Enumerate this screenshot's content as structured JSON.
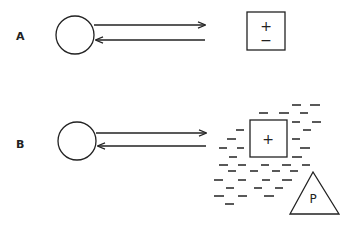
{
  "panels": [
    {
      "label": "A",
      "box_symbols": [
        "+",
        "−"
      ],
      "description": "Circle with outgoing and returning arrows; isolated box containing + and − charges"
    },
    {
      "label": "B",
      "box_symbols": [
        "+"
      ],
      "triangle_label": "P",
      "description": "Circle with outgoing and returning arrows; box with + surrounded by a field of − charges, triangle labeled P"
    }
  ],
  "colors": {
    "ink": "#222222",
    "background": "#ffffff"
  },
  "dashes_b": [
    [
      292,
      105,
      301
    ],
    [
      310,
      105,
      320
    ],
    [
      259,
      113,
      268
    ],
    [
      279,
      113,
      289
    ],
    [
      300,
      113,
      308
    ],
    [
      292,
      122,
      300
    ],
    [
      312,
      122,
      321
    ],
    [
      236,
      130,
      244
    ],
    [
      303,
      130,
      311
    ],
    [
      227,
      139,
      236
    ],
    [
      292,
      139,
      300
    ],
    [
      219,
      148,
      227
    ],
    [
      237,
      148,
      244
    ],
    [
      300,
      148,
      310
    ],
    [
      229,
      157,
      237
    ],
    [
      292,
      157,
      302
    ],
    [
      219,
      165,
      228
    ],
    [
      238,
      165,
      246
    ],
    [
      261,
      165,
      269
    ],
    [
      282,
      165,
      291
    ],
    [
      302,
      165,
      310
    ],
    [
      228,
      171,
      236
    ],
    [
      250,
      171,
      258
    ],
    [
      272,
      171,
      280
    ],
    [
      290,
      171,
      298
    ],
    [
      214,
      180,
      223
    ],
    [
      238,
      180,
      246
    ],
    [
      262,
      180,
      270
    ],
    [
      282,
      180,
      292
    ],
    [
      226,
      188,
      234
    ],
    [
      254,
      188,
      262
    ],
    [
      275,
      188,
      283
    ],
    [
      214,
      196,
      224
    ],
    [
      238,
      196,
      247
    ],
    [
      264,
      196,
      274
    ],
    [
      225,
      204,
      234
    ]
  ]
}
